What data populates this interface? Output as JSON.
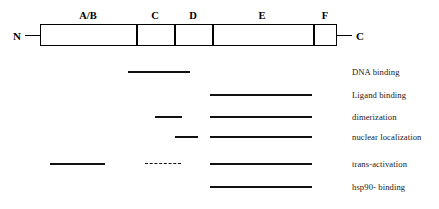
{
  "receptor": {
    "n_terminus_label": "N",
    "c_terminus_label": "C",
    "domains": [
      {
        "label": "A/B",
        "x": 40,
        "width": 96,
        "center": 88
      },
      {
        "label": "C",
        "x": 136,
        "width": 38,
        "center": 155
      },
      {
        "label": "D",
        "x": 174,
        "width": 38,
        "center": 193
      },
      {
        "label": "E",
        "x": 212,
        "width": 101,
        "center": 262
      },
      {
        "label": "F",
        "x": 313,
        "width": 24,
        "center": 325
      }
    ],
    "box": {
      "x": 40,
      "y": 24,
      "width": 297,
      "height": 22
    },
    "dividers_x": [
      136,
      174,
      212,
      313
    ]
  },
  "functions": [
    {
      "label": "DNA binding",
      "label_x": 352,
      "label_y": 68,
      "segments": [
        {
          "x": 128,
          "y": 71,
          "width": 62,
          "style": "solid"
        }
      ]
    },
    {
      "label": "Ligand binding",
      "label_x": 352,
      "label_y": 91,
      "segments": [
        {
          "x": 210,
          "y": 94,
          "width": 102,
          "style": "solid"
        }
      ]
    },
    {
      "label": "dimerization",
      "label_x": 352,
      "label_y": 113,
      "segments": [
        {
          "x": 155,
          "y": 116,
          "width": 27,
          "style": "solid"
        },
        {
          "x": 210,
          "y": 116,
          "width": 102,
          "style": "solid"
        }
      ]
    },
    {
      "label": "nuclear localization",
      "label_x": 352,
      "label_y": 133,
      "segments": [
        {
          "x": 175,
          "y": 136,
          "width": 23,
          "style": "solid"
        },
        {
          "x": 210,
          "y": 136,
          "width": 102,
          "style": "solid"
        }
      ]
    },
    {
      "label": "trans-activation",
      "label_x": 352,
      "label_y": 160,
      "segments": [
        {
          "x": 50,
          "y": 163,
          "width": 55,
          "style": "solid"
        },
        {
          "x": 145,
          "y": 163,
          "width": 36,
          "style": "dashed"
        },
        {
          "x": 210,
          "y": 163,
          "width": 102,
          "style": "solid"
        }
      ]
    },
    {
      "label": "hsp90- binding",
      "label_x": 352,
      "label_y": 183,
      "segments": [
        {
          "x": 210,
          "y": 186,
          "width": 102,
          "style": "solid"
        }
      ]
    }
  ],
  "colors": {
    "stroke": "#000000",
    "line": "#111111",
    "text": "#1a1a1a",
    "background": "#ffffff"
  }
}
